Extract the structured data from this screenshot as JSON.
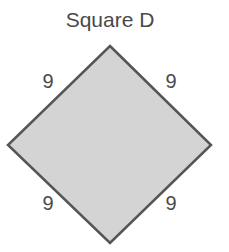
{
  "title": "Square D",
  "shape": {
    "type": "square",
    "orientation": "rotated-45",
    "fill": "#d4d4d4",
    "stroke": "#555555"
  },
  "side_labels": [
    {
      "position": "top-left",
      "value": "9"
    },
    {
      "position": "top-right",
      "value": "9"
    },
    {
      "position": "bottom-left",
      "value": "9"
    },
    {
      "position": "bottom-right",
      "value": "9"
    }
  ]
}
